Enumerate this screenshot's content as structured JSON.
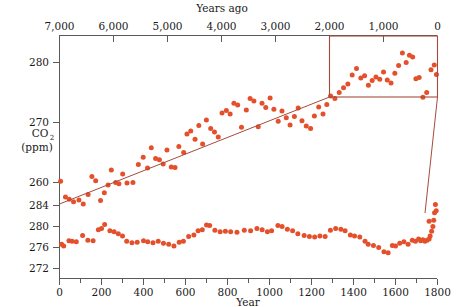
{
  "figure": {
    "top_axis_title": "Years ago",
    "bottom_axis_title": "Year",
    "y_axis_title_main": "CO",
    "y_axis_title_sub": "2",
    "y_axis_title_units": "(ppm)"
  },
  "chart_data": {
    "type": "scatter",
    "title": "",
    "panels": [
      {
        "name": "upper-panel",
        "xlabel": "Years ago",
        "ylabel": "CO2 (ppm)",
        "x_axis_position": "top",
        "x_direction": "reversed",
        "xlim": [
          7000,
          0
        ],
        "ylim": [
          255,
          283
        ],
        "xticks": [
          7000,
          6000,
          5000,
          4000,
          3000,
          2000,
          1000,
          0
        ],
        "xticklabels": [
          "7,000",
          "6,000",
          "5,000",
          "4,000",
          "3,000",
          "2,000",
          "1,000",
          "0"
        ],
        "yticks": [
          280,
          270,
          260
        ],
        "yticklabels": [
          "280",
          "270",
          "260"
        ],
        "grid": false,
        "points": [
          [
            6980,
            260.2
          ],
          [
            6890,
            257.6
          ],
          [
            6820,
            257.2
          ],
          [
            6740,
            256.8
          ],
          [
            6640,
            257.1
          ],
          [
            6560,
            256.4
          ],
          [
            6470,
            258.0
          ],
          [
            6400,
            261.0
          ],
          [
            6330,
            260.3
          ],
          [
            6240,
            257.0
          ],
          [
            6170,
            258.3
          ],
          [
            6100,
            259.6
          ],
          [
            6040,
            262.1
          ],
          [
            5960,
            260.0
          ],
          [
            5900,
            259.8
          ],
          [
            5830,
            261.4
          ],
          [
            5750,
            259.9
          ],
          [
            5640,
            260.0
          ],
          [
            5540,
            263.0
          ],
          [
            5450,
            264.2
          ],
          [
            5370,
            262.4
          ],
          [
            5300,
            265.8
          ],
          [
            5220,
            264.0
          ],
          [
            5150,
            263.8
          ],
          [
            5080,
            263.1
          ],
          [
            5010,
            265.4
          ],
          [
            4930,
            262.6
          ],
          [
            4860,
            262.5
          ],
          [
            4790,
            266.0
          ],
          [
            4700,
            265.0
          ],
          [
            4640,
            268.1
          ],
          [
            4570,
            268.6
          ],
          [
            4490,
            267.2
          ],
          [
            4420,
            269.5
          ],
          [
            4350,
            266.4
          ],
          [
            4280,
            270.4
          ],
          [
            4200,
            269.0
          ],
          [
            4130,
            268.4
          ],
          [
            4060,
            267.6
          ],
          [
            3990,
            271.6
          ],
          [
            3910,
            272.0
          ],
          [
            3840,
            271.4
          ],
          [
            3770,
            273.2
          ],
          [
            3700,
            272.9
          ],
          [
            3630,
            269.2
          ],
          [
            3540,
            272.1
          ],
          [
            3470,
            274.0
          ],
          [
            3400,
            273.6
          ],
          [
            3320,
            269.3
          ],
          [
            3250,
            273.2
          ],
          [
            3180,
            272.5
          ],
          [
            3100,
            274.1
          ],
          [
            3030,
            272.2
          ],
          [
            2950,
            270.2
          ],
          [
            2880,
            271.9
          ],
          [
            2800,
            270.8
          ],
          [
            2730,
            269.6
          ],
          [
            2650,
            271.0
          ],
          [
            2580,
            272.4
          ],
          [
            2510,
            270.3
          ],
          [
            2430,
            269.4
          ],
          [
            2350,
            269.0
          ],
          [
            2280,
            271.1
          ],
          [
            2200,
            272.6
          ],
          [
            2120,
            271.4
          ],
          [
            2050,
            273.0
          ],
          [
            1980,
            274.4
          ],
          [
            1900,
            274.0
          ],
          [
            1820,
            275.0
          ],
          [
            1740,
            275.8
          ],
          [
            1660,
            276.4
          ],
          [
            1580,
            277.9
          ],
          [
            1500,
            279.0
          ],
          [
            1420,
            277.4
          ],
          [
            1350,
            277.8
          ],
          [
            1280,
            276.2
          ],
          [
            1210,
            277.0
          ],
          [
            1140,
            277.6
          ],
          [
            1070,
            277.2
          ],
          [
            1000,
            278.4
          ],
          [
            930,
            277.1
          ],
          [
            860,
            276.6
          ],
          [
            790,
            278.2
          ],
          [
            720,
            279.5
          ],
          [
            650,
            281.6
          ],
          [
            580,
            280.0
          ],
          [
            520,
            281.2
          ],
          [
            460,
            280.9
          ],
          [
            400,
            277.3
          ],
          [
            340,
            277.5
          ],
          [
            270,
            274.2
          ],
          [
            200,
            275.0
          ],
          [
            120,
            278.8
          ],
          [
            60,
            279.6
          ],
          [
            20,
            278.0
          ]
        ]
      },
      {
        "name": "lower-panel",
        "xlabel": "Year",
        "ylabel": "CO2 (ppm)",
        "x_axis_position": "bottom",
        "x_direction": "normal",
        "xlim": [
          0,
          1800
        ],
        "ylim": [
          272,
          286
        ],
        "xticks": [
          0,
          200,
          400,
          600,
          800,
          1000,
          1200,
          1400,
          1600,
          1800
        ],
        "xticklabels": [
          "0",
          "200",
          "400",
          "600",
          "800",
          "1000",
          "1200",
          "1400",
          "1600",
          "1800"
        ],
        "xticks_minor": [
          100,
          300,
          500,
          700,
          900,
          1100,
          1300,
          1500,
          1700
        ],
        "yticks": [
          284,
          280,
          276,
          272
        ],
        "yticklabels": [
          "284",
          "280",
          "276",
          "272"
        ],
        "grid": false,
        "points": [
          [
            10,
            276.6
          ],
          [
            20,
            276.3
          ],
          [
            45,
            277.3
          ],
          [
            60,
            277.2
          ],
          [
            80,
            277.1
          ],
          [
            110,
            278.3
          ],
          [
            135,
            277.4
          ],
          [
            160,
            277.3
          ],
          [
            185,
            279.4
          ],
          [
            200,
            279.6
          ],
          [
            215,
            280.4
          ],
          [
            240,
            279.2
          ],
          [
            260,
            279.0
          ],
          [
            280,
            278.6
          ],
          [
            300,
            278.2
          ],
          [
            320,
            277.2
          ],
          [
            345,
            276.9
          ],
          [
            370,
            277.0
          ],
          [
            400,
            277.3
          ],
          [
            420,
            277.1
          ],
          [
            445,
            276.9
          ],
          [
            470,
            277.2
          ],
          [
            495,
            276.8
          ],
          [
            520,
            276.6
          ],
          [
            545,
            276.3
          ],
          [
            570,
            277.0
          ],
          [
            590,
            277.2
          ],
          [
            615,
            278.1
          ],
          [
            640,
            278.4
          ],
          [
            660,
            279.2
          ],
          [
            680,
            279.4
          ],
          [
            700,
            280.3
          ],
          [
            715,
            280.2
          ],
          [
            740,
            279.3
          ],
          [
            765,
            279.0
          ],
          [
            790,
            279.1
          ],
          [
            815,
            279.0
          ],
          [
            845,
            278.9
          ],
          [
            880,
            279.3
          ],
          [
            910,
            279.2
          ],
          [
            940,
            279.6
          ],
          [
            965,
            279.4
          ],
          [
            990,
            279.0
          ],
          [
            1010,
            279.2
          ],
          [
            1040,
            280.2
          ],
          [
            1060,
            280.0
          ],
          [
            1085,
            279.5
          ],
          [
            1110,
            279.2
          ],
          [
            1135,
            278.6
          ],
          [
            1165,
            278.3
          ],
          [
            1190,
            278.1
          ],
          [
            1215,
            278.0
          ],
          [
            1240,
            278.2
          ],
          [
            1265,
            278.1
          ],
          [
            1290,
            279.3
          ],
          [
            1315,
            279.6
          ],
          [
            1340,
            279.5
          ],
          [
            1360,
            279.2
          ],
          [
            1385,
            278.4
          ],
          [
            1405,
            278.2
          ],
          [
            1430,
            278.0
          ],
          [
            1455,
            277.2
          ],
          [
            1470,
            276.6
          ],
          [
            1495,
            276.4
          ],
          [
            1520,
            276.0
          ],
          [
            1545,
            275.2
          ],
          [
            1565,
            275.0
          ],
          [
            1585,
            276.4
          ],
          [
            1600,
            276.3
          ],
          [
            1620,
            276.8
          ],
          [
            1640,
            277.1
          ],
          [
            1660,
            276.6
          ],
          [
            1680,
            277.4
          ],
          [
            1695,
            277.2
          ],
          [
            1710,
            277.6
          ],
          [
            1720,
            277.3
          ],
          [
            1730,
            277.5
          ],
          [
            1740,
            277.2
          ],
          [
            1750,
            277.4
          ],
          [
            1760,
            277.6
          ],
          [
            1765,
            278.2
          ],
          [
            1772,
            279.1
          ],
          [
            1778,
            280.0
          ],
          [
            1782,
            281.2
          ],
          [
            1786,
            282.6
          ],
          [
            1790,
            284.2
          ],
          [
            1794,
            283.0
          ],
          [
            1760,
            281.0
          ]
        ]
      }
    ],
    "inset": {
      "name": "inset-highlight-box",
      "description": "Rectangle on upper panel highlighting the most recent ~2000 years, expanded in the lower panel",
      "x_range_years_ago": [
        2000,
        0
      ],
      "y_range_ppm": [
        274,
        282.5
      ]
    },
    "series_color": "#e4502c",
    "inset_color": "#a64b3a"
  }
}
